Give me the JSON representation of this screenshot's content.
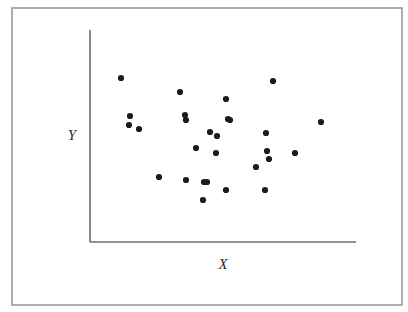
{
  "figure": {
    "kind": "scatterplot-figure",
    "width": 408,
    "height": 312,
    "background_color": "#ffffff",
    "frame": {
      "name": "figure-border",
      "x": 12,
      "y": 8,
      "width": 390,
      "height": 297,
      "stroke_color": "#8a8a8a",
      "stroke_width": 1.4
    }
  },
  "axes": {
    "origin_x": 90,
    "origin_y": 242,
    "y_axis_top": 30,
    "x_axis_right": 356,
    "stroke_color": "#6e6e6e",
    "stroke_width": 1.6,
    "y_label": "Y",
    "x_label": "X",
    "y_label_pos": {
      "x": 72,
      "y": 137
    },
    "x_label_pos": {
      "x": 223,
      "y": 266
    }
  },
  "marker": {
    "shape": "circle",
    "radius": 3.1,
    "fill_color": "#1b1b1b",
    "stroke_color": "#1b1b1b"
  },
  "chart_data": {
    "type": "scatter",
    "title": "",
    "xlabel": "X",
    "ylabel": "Y",
    "grid": false,
    "legend": "none",
    "xlim": [
      0,
      100
    ],
    "ylim": [
      0,
      100
    ],
    "axis_pixel_box": {
      "x0": 90,
      "y0": 242,
      "x1": 356,
      "y1": 30
    },
    "n_points": 28,
    "series": [
      {
        "name": "observations",
        "color": "#1b1b1b",
        "points_px": [
          {
            "x": 121,
            "y": 78
          },
          {
            "x": 180,
            "y": 92
          },
          {
            "x": 226,
            "y": 99
          },
          {
            "x": 273,
            "y": 81
          },
          {
            "x": 130,
            "y": 116
          },
          {
            "x": 129,
            "y": 125
          },
          {
            "x": 139,
            "y": 129
          },
          {
            "x": 185,
            "y": 115
          },
          {
            "x": 228,
            "y": 119
          },
          {
            "x": 321,
            "y": 122
          },
          {
            "x": 210,
            "y": 132
          },
          {
            "x": 217,
            "y": 136
          },
          {
            "x": 266,
            "y": 133
          },
          {
            "x": 196,
            "y": 148
          },
          {
            "x": 216,
            "y": 153
          },
          {
            "x": 267,
            "y": 151
          },
          {
            "x": 295,
            "y": 153
          },
          {
            "x": 269,
            "y": 159
          },
          {
            "x": 256,
            "y": 167
          },
          {
            "x": 159,
            "y": 177
          },
          {
            "x": 186,
            "y": 180
          },
          {
            "x": 207,
            "y": 182
          },
          {
            "x": 226,
            "y": 190
          },
          {
            "x": 265,
            "y": 190
          },
          {
            "x": 203,
            "y": 200
          },
          {
            "x": 204,
            "y": 182
          },
          {
            "x": 230,
            "y": 120
          },
          {
            "x": 186,
            "y": 120
          }
        ],
        "points_data": [
          {
            "x": 12,
            "y": 77
          },
          {
            "x": 34,
            "y": 71
          },
          {
            "x": 51,
            "y": 67
          },
          {
            "x": 69,
            "y": 76
          },
          {
            "x": 15,
            "y": 59
          },
          {
            "x": 15,
            "y": 55
          },
          {
            "x": 18,
            "y": 53
          },
          {
            "x": 36,
            "y": 60
          },
          {
            "x": 52,
            "y": 58
          },
          {
            "x": 87,
            "y": 57
          },
          {
            "x": 45,
            "y": 52
          },
          {
            "x": 48,
            "y": 50
          },
          {
            "x": 66,
            "y": 51
          },
          {
            "x": 40,
            "y": 44
          },
          {
            "x": 47,
            "y": 42
          },
          {
            "x": 67,
            "y": 43
          },
          {
            "x": 77,
            "y": 42
          },
          {
            "x": 67,
            "y": 39
          },
          {
            "x": 62,
            "y": 35
          },
          {
            "x": 26,
            "y": 31
          },
          {
            "x": 36,
            "y": 29
          },
          {
            "x": 44,
            "y": 28
          },
          {
            "x": 51,
            "y": 25
          },
          {
            "x": 66,
            "y": 25
          },
          {
            "x": 42,
            "y": 20
          },
          {
            "x": 43,
            "y": 28
          },
          {
            "x": 53,
            "y": 58
          },
          {
            "x": 36,
            "y": 58
          }
        ]
      }
    ]
  }
}
